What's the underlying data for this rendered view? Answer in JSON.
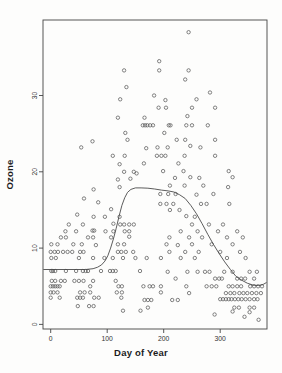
{
  "figure": {
    "width": 282,
    "height": 373,
    "background": "#fdfdfc"
  },
  "chart_data": {
    "type": "scatter",
    "title": "",
    "xlabel": "Day of Year",
    "ylabel": "Ozone",
    "x_ticks": [
      0,
      100,
      200,
      300
    ],
    "y_ticks": [
      0,
      10,
      20,
      30
    ],
    "xlim": [
      -13.6,
      382.8
    ],
    "ylim": [
      -0.6,
      39.9
    ],
    "grid": false,
    "legend": "none",
    "marker": "open-circle",
    "marker_color": "#5a5a5a",
    "curve_color": "#4a4a4a",
    "axis_color": "#444444",
    "tick_label_color": "#333333",
    "plot_box": {
      "left": 43,
      "top": 20,
      "right": 267,
      "bottom": 329
    },
    "smooth_curve": [
      [
        -13,
        7.2
      ],
      [
        20,
        7.2
      ],
      [
        45,
        7.2
      ],
      [
        62,
        7.2
      ],
      [
        75,
        7.3
      ],
      [
        83,
        7.5
      ],
      [
        90,
        7.8
      ],
      [
        96,
        8.3
      ],
      [
        101,
        9.0
      ],
      [
        106,
        10.0
      ],
      [
        111,
        11.2
      ],
      [
        116,
        12.6
      ],
      [
        121,
        14.2
      ],
      [
        126,
        15.6
      ],
      [
        131,
        16.6
      ],
      [
        136,
        17.3
      ],
      [
        142,
        17.7
      ],
      [
        150,
        17.9
      ],
      [
        160,
        17.9
      ],
      [
        172,
        17.85
      ],
      [
        184,
        17.75
      ],
      [
        196,
        17.6
      ],
      [
        208,
        17.5
      ],
      [
        218,
        17.35
      ],
      [
        228,
        17.0
      ],
      [
        238,
        16.5
      ],
      [
        248,
        15.6
      ],
      [
        258,
        14.5
      ],
      [
        268,
        13.2
      ],
      [
        278,
        11.8
      ],
      [
        288,
        10.5
      ],
      [
        298,
        9.3
      ],
      [
        308,
        8.2
      ],
      [
        318,
        7.2
      ],
      [
        328,
        6.3
      ],
      [
        338,
        5.8
      ],
      [
        348,
        5.4
      ],
      [
        358,
        5.15
      ],
      [
        368,
        5.1
      ],
      [
        376,
        5.25
      ],
      [
        382,
        5.5
      ]
    ],
    "points": [
      [
        244,
        38.3
      ],
      [
        192,
        34.5
      ],
      [
        130,
        33.3
      ],
      [
        192,
        33.3
      ],
      [
        244,
        33.3
      ],
      [
        238,
        32.1
      ],
      [
        134,
        31.1
      ],
      [
        282,
        30.4
      ],
      [
        183,
        30.0
      ],
      [
        123,
        29.5
      ],
      [
        258,
        29.5
      ],
      [
        203,
        29.4
      ],
      [
        191,
        28.4
      ],
      [
        204,
        28.4
      ],
      [
        250,
        28.4
      ],
      [
        291,
        28.4
      ],
      [
        242,
        27.3
      ],
      [
        119,
        27.1
      ],
      [
        166,
        27.1
      ],
      [
        163,
        26.1
      ],
      [
        167,
        26.1
      ],
      [
        171,
        26.1
      ],
      [
        176,
        26.1
      ],
      [
        181,
        26.1
      ],
      [
        209,
        26.1
      ],
      [
        212,
        26.1
      ],
      [
        240,
        26.1
      ],
      [
        250,
        26.1
      ],
      [
        278,
        26.1
      ],
      [
        132,
        25.1
      ],
      [
        201,
        25.1
      ],
      [
        136,
        24.2
      ],
      [
        74,
        24.0
      ],
      [
        223,
        24.2
      ],
      [
        238,
        24.2
      ],
      [
        291,
        24.2
      ],
      [
        54,
        23.2
      ],
      [
        169,
        23.1
      ],
      [
        189,
        23.2
      ],
      [
        207,
        23.2
      ],
      [
        247,
        23.4
      ],
      [
        265,
        23.2
      ],
      [
        110,
        22.1
      ],
      [
        131,
        22.1
      ],
      [
        188,
        22.1
      ],
      [
        196,
        22.1
      ],
      [
        203,
        22.1
      ],
      [
        237,
        22.1
      ],
      [
        291,
        22.1
      ],
      [
        122,
        21.0
      ],
      [
        165,
        21.1
      ],
      [
        226,
        21.1
      ],
      [
        130,
        20.0
      ],
      [
        147,
        20.0
      ],
      [
        199,
        20.1
      ],
      [
        235,
        20.1
      ],
      [
        315,
        20.1
      ],
      [
        119,
        19.0
      ],
      [
        141,
        19.1
      ],
      [
        152,
        19.8
      ],
      [
        220,
        19.2
      ],
      [
        247,
        19.3
      ],
      [
        263,
        19.2
      ],
      [
        322,
        19.3
      ],
      [
        122,
        18.0
      ],
      [
        211,
        18.2
      ],
      [
        237,
        18.2
      ],
      [
        270,
        18.2
      ],
      [
        314,
        18.0
      ],
      [
        76,
        17.7
      ],
      [
        194,
        17.1
      ],
      [
        208,
        17.1
      ],
      [
        221,
        17.1
      ],
      [
        258,
        17.0
      ],
      [
        288,
        17.1
      ],
      [
        59,
        16.5
      ],
      [
        84,
        16.0
      ],
      [
        194,
        15.8
      ],
      [
        205,
        15.8
      ],
      [
        217,
        15.8
      ],
      [
        266,
        15.8
      ],
      [
        276,
        15.8
      ],
      [
        316,
        15.8
      ],
      [
        107,
        15.1
      ],
      [
        211,
        15.0
      ],
      [
        228,
        15.0
      ],
      [
        47,
        14.4
      ],
      [
        76,
        14.1
      ],
      [
        96,
        14.1
      ],
      [
        122,
        14.1
      ],
      [
        240,
        14.2
      ],
      [
        255,
        14.1
      ],
      [
        32,
        13.1
      ],
      [
        57,
        13.1
      ],
      [
        111,
        13.2
      ],
      [
        123,
        13.1
      ],
      [
        130,
        13.1
      ],
      [
        139,
        13.1
      ],
      [
        147,
        13.1
      ],
      [
        250,
        13.1
      ],
      [
        280,
        13.1
      ],
      [
        305,
        13.1
      ],
      [
        26,
        12.2
      ],
      [
        45,
        12.2
      ],
      [
        74,
        12.3
      ],
      [
        77,
        12.3
      ],
      [
        97,
        12.2
      ],
      [
        111,
        12.2
      ],
      [
        131,
        12.2
      ],
      [
        139,
        12.2
      ],
      [
        230,
        12.2
      ],
      [
        260,
        12.2
      ],
      [
        296,
        12.2
      ],
      [
        330,
        12.2
      ],
      [
        18,
        11.4
      ],
      [
        27,
        11.4
      ],
      [
        66,
        11.4
      ],
      [
        75,
        11.4
      ],
      [
        107,
        11.4
      ],
      [
        139,
        11.5
      ],
      [
        210,
        11.4
      ],
      [
        245,
        11.4
      ],
      [
        268,
        11.4
      ],
      [
        312,
        11.4
      ],
      [
        340,
        11.4
      ],
      [
        1,
        10.5
      ],
      [
        12,
        10.5
      ],
      [
        40,
        10.5
      ],
      [
        55,
        10.5
      ],
      [
        80,
        10.4
      ],
      [
        119,
        10.5
      ],
      [
        130,
        10.5
      ],
      [
        205,
        10.5
      ],
      [
        225,
        10.4
      ],
      [
        250,
        10.5
      ],
      [
        285,
        10.5
      ],
      [
        322,
        10.5
      ],
      [
        0,
        9.5
      ],
      [
        7,
        9.5
      ],
      [
        13,
        9.5
      ],
      [
        22,
        9.5
      ],
      [
        30,
        9.5
      ],
      [
        38,
        9.5
      ],
      [
        52,
        9.5
      ],
      [
        58,
        9.5
      ],
      [
        119,
        9.5
      ],
      [
        125,
        9.5
      ],
      [
        133,
        9.5
      ],
      [
        146,
        9.5
      ],
      [
        210,
        9.5
      ],
      [
        238,
        9.5
      ],
      [
        262,
        9.5
      ],
      [
        300,
        9.5
      ],
      [
        335,
        9.5
      ],
      [
        1,
        8.7
      ],
      [
        9,
        8.7
      ],
      [
        50,
        8.7
      ],
      [
        75,
        8.7
      ],
      [
        95,
        8.7
      ],
      [
        110,
        8.7
      ],
      [
        128,
        8.7
      ],
      [
        150,
        8.7
      ],
      [
        170,
        8.7
      ],
      [
        195,
        8.7
      ],
      [
        230,
        8.7
      ],
      [
        255,
        8.7
      ],
      [
        312,
        8.7
      ],
      [
        345,
        8.7
      ],
      [
        1,
        7.0
      ],
      [
        4,
        7.0
      ],
      [
        8,
        7.0
      ],
      [
        27,
        7.0
      ],
      [
        45,
        7.0
      ],
      [
        57,
        7.0
      ],
      [
        62,
        7.0
      ],
      [
        66,
        7.0
      ],
      [
        89,
        7.0
      ],
      [
        105,
        7.0
      ],
      [
        110,
        7.0
      ],
      [
        115,
        7.0
      ],
      [
        158,
        7.0
      ],
      [
        207,
        6.9
      ],
      [
        242,
        6.9
      ],
      [
        260,
        6.9
      ],
      [
        273,
        6.9
      ],
      [
        281,
        6.9
      ],
      [
        307,
        6.9
      ],
      [
        322,
        6.9
      ],
      [
        352,
        6.9
      ],
      [
        365,
        6.9
      ],
      [
        2,
        5.7
      ],
      [
        8,
        5.7
      ],
      [
        18,
        5.7
      ],
      [
        25,
        5.7
      ],
      [
        42,
        5.7
      ],
      [
        50,
        5.7
      ],
      [
        58,
        5.7
      ],
      [
        75,
        5.7
      ],
      [
        115,
        5.7
      ],
      [
        221,
        6.0
      ],
      [
        291,
        6.0
      ],
      [
        298,
        6.0
      ],
      [
        303,
        6.0
      ],
      [
        330,
        6.0
      ],
      [
        337,
        6.0
      ],
      [
        344,
        6.0
      ],
      [
        360,
        6.0
      ],
      [
        0,
        5.0
      ],
      [
        4,
        5.0
      ],
      [
        8,
        5.0
      ],
      [
        12,
        5.0
      ],
      [
        16,
        5.0
      ],
      [
        70,
        5.0
      ],
      [
        120,
        5.0
      ],
      [
        126,
        5.0
      ],
      [
        164,
        5.0
      ],
      [
        175,
        5.0
      ],
      [
        181,
        5.0
      ],
      [
        195,
        5.0
      ],
      [
        240,
        5.0
      ],
      [
        276,
        5.0
      ],
      [
        285,
        5.0
      ],
      [
        293,
        5.0
      ],
      [
        315,
        5.0
      ],
      [
        322,
        5.0
      ],
      [
        330,
        5.0
      ],
      [
        337,
        5.0
      ],
      [
        353,
        5.0
      ],
      [
        360,
        5.0
      ],
      [
        367,
        5.0
      ],
      [
        374,
        5.0
      ],
      [
        0,
        4.2
      ],
      [
        5,
        4.2
      ],
      [
        12,
        4.2
      ],
      [
        52,
        4.2
      ],
      [
        60,
        4.2
      ],
      [
        70,
        4.2
      ],
      [
        117,
        4.2
      ],
      [
        126,
        4.2
      ],
      [
        195,
        4.2
      ],
      [
        245,
        4.1
      ],
      [
        310,
        4.1
      ],
      [
        318,
        4.1
      ],
      [
        325,
        4.1
      ],
      [
        334,
        4.1
      ],
      [
        341,
        4.1
      ],
      [
        348,
        4.1
      ],
      [
        356,
        4.1
      ],
      [
        364,
        4.1
      ],
      [
        372,
        4.1
      ],
      [
        0,
        3.5
      ],
      [
        16,
        3.5
      ],
      [
        47,
        3.5
      ],
      [
        52,
        3.5
      ],
      [
        57,
        3.5
      ],
      [
        77,
        3.5
      ],
      [
        85,
        3.5
      ],
      [
        125,
        3.5
      ],
      [
        166,
        3.2
      ],
      [
        172,
        3.2
      ],
      [
        178,
        3.2
      ],
      [
        215,
        3.2
      ],
      [
        225,
        3.2
      ],
      [
        300,
        3.3
      ],
      [
        305,
        3.3
      ],
      [
        310,
        3.3
      ],
      [
        315,
        3.3
      ],
      [
        320,
        3.3
      ],
      [
        326,
        3.3
      ],
      [
        332,
        3.3
      ],
      [
        338,
        3.3
      ],
      [
        345,
        3.3
      ],
      [
        352,
        3.3
      ],
      [
        360,
        3.3
      ],
      [
        366,
        3.3
      ],
      [
        48,
        2.4
      ],
      [
        68,
        2.4
      ],
      [
        76,
        2.4
      ],
      [
        172,
        2.2
      ],
      [
        325,
        2.2
      ],
      [
        333,
        2.2
      ],
      [
        352,
        2.2
      ],
      [
        360,
        2.2
      ],
      [
        128,
        1.8
      ],
      [
        159,
        1.8
      ],
      [
        290,
        1.3
      ],
      [
        322,
        1.7
      ],
      [
        352,
        1.6
      ],
      [
        343,
        1.0
      ],
      [
        368,
        0.6
      ]
    ]
  }
}
